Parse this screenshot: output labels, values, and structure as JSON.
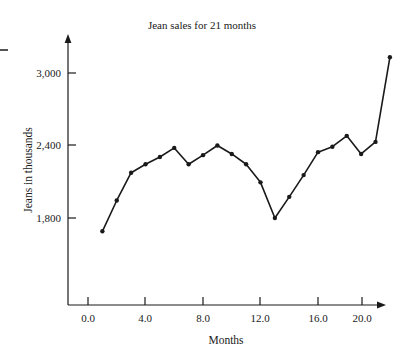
{
  "chart_data": {
    "type": "line",
    "title": "Jean sales for 21 months",
    "xlabel": "Months",
    "ylabel": "Jeans in thousands",
    "x": [
      1,
      2,
      3,
      4,
      5,
      6,
      7,
      8,
      9,
      10,
      11,
      12,
      13,
      14,
      15,
      16,
      17,
      18,
      19,
      20,
      21
    ],
    "values": [
      1690,
      1945,
      2175,
      2245,
      2305,
      2380,
      2245,
      2320,
      2400,
      2330,
      2245,
      2095,
      1800,
      1975,
      2155,
      2345,
      2390,
      2480,
      2330,
      2430,
      3130
    ],
    "series": [
      {
        "name": "Jean sales",
        "values": [
          1690,
          1945,
          2175,
          2245,
          2305,
          2380,
          2245,
          2320,
          2400,
          2330,
          2245,
          2095,
          1800,
          1975,
          2155,
          2345,
          2390,
          2480,
          2330,
          2430,
          3130
        ]
      }
    ],
    "xticks": [
      0.0,
      4.0,
      8.0,
      12.0,
      16.0,
      20.0
    ],
    "xtick_labels": [
      "0.0",
      "4.0",
      "8.0",
      "12.0",
      "16.0",
      "20.0"
    ],
    "yticks": [
      1800,
      2400,
      3000
    ],
    "ytick_labels": [
      "1,800",
      "2,400",
      "3,000"
    ],
    "xlim": [
      -0.5,
      22.0
    ],
    "ylim": [
      1400,
      3250
    ],
    "grid": false,
    "legend": null,
    "marker": "filled-circle",
    "line_color": "#1a1a1a",
    "marker_color": "#1a1a1a",
    "background_color": "#ffffff",
    "axis_style": "arrow-ended-left-and-bottom-spines"
  },
  "labels": {
    "title": "Jean sales for 21 months",
    "x_axis_title": "Months",
    "y_axis_title": "Jeans in thousands",
    "x_tick_0": "0.0",
    "x_tick_1": "4.0",
    "x_tick_2": "8.0",
    "x_tick_3": "12.0",
    "x_tick_4": "16.0",
    "x_tick_5": "20.0",
    "y_tick_0": "1,800",
    "y_tick_1": "2,400",
    "y_tick_2": "3,000"
  }
}
